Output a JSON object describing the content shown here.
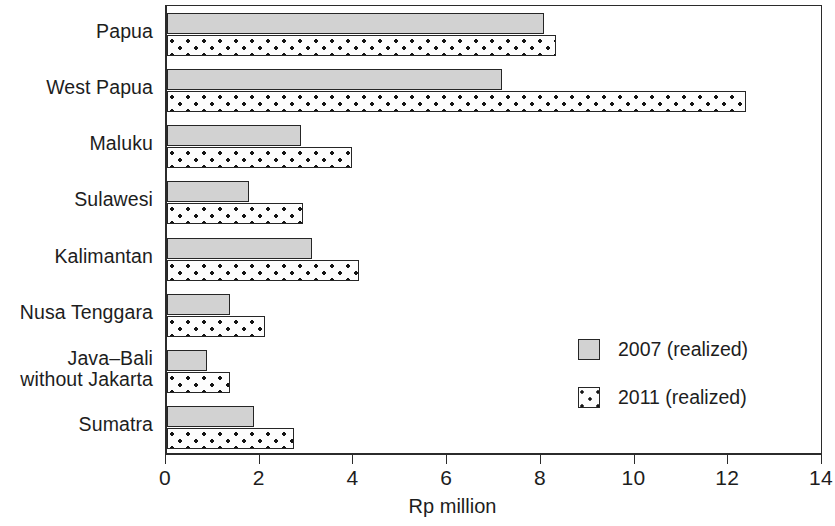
{
  "chart_data": {
    "type": "bar",
    "orientation": "horizontal",
    "title": "",
    "xlabel": "Rp million",
    "ylabel": "",
    "xlim": [
      0,
      14
    ],
    "xticks": [
      0,
      2,
      4,
      6,
      8,
      10,
      12,
      14
    ],
    "xtick_labels": [
      "0",
      "2",
      "4",
      "6",
      "8",
      "10",
      "12",
      "14"
    ],
    "grid": false,
    "legend_position": "inside-right",
    "categories": [
      "Papua",
      "West Papua",
      "Maluku",
      "Sulawesi",
      "Kalimantan",
      "Nusa Tenggara",
      "Java–Bali\nwithout Jakarta",
      "Sumatra"
    ],
    "series": [
      {
        "name": "2007 (realized)",
        "fill": "solid-gray",
        "color": "#d2d2d2",
        "values": [
          8.05,
          7.15,
          2.85,
          1.75,
          3.1,
          1.35,
          0.85,
          1.85
        ]
      },
      {
        "name": "2011 (realized)",
        "fill": "dotted",
        "color": "#ffffff",
        "values": [
          8.3,
          12.35,
          3.95,
          2.9,
          4.1,
          2.1,
          1.35,
          2.7
        ]
      }
    ]
  },
  "legend": {
    "items": [
      {
        "label": "2007 (realized)",
        "style": "s2007"
      },
      {
        "label": "2011 (realized)",
        "style": "s2011"
      }
    ]
  },
  "axis": {
    "x_title": "Rp million"
  }
}
